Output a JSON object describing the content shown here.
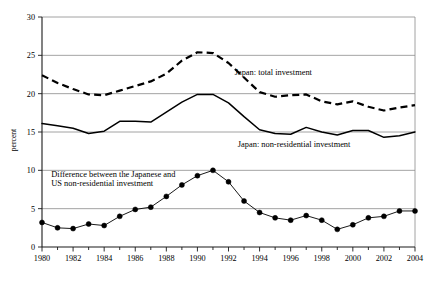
{
  "chart_data": {
    "type": "line",
    "title": "",
    "subtitle": "",
    "xlabel": "",
    "ylabel": "percent",
    "xlim": [
      1980,
      2004
    ],
    "ylim": [
      0,
      30
    ],
    "yticks": [
      0,
      5,
      10,
      15,
      20,
      25,
      30
    ],
    "ytick_labels": [
      "0",
      "5",
      "10",
      "15",
      "20",
      "25",
      "30"
    ],
    "xticks": [
      1980,
      1982,
      1984,
      1986,
      1988,
      1990,
      1992,
      1994,
      1996,
      1998,
      2000,
      2002,
      2004
    ],
    "xtick_labels": [
      "1980",
      "1982",
      "1984",
      "1986",
      "1988",
      "1990",
      "1992",
      "1994",
      "1996",
      "1998",
      "2000",
      "2002",
      "2004"
    ],
    "x_minor_tick_step": 1,
    "grid": "horizontal",
    "legend_position": "inline-annotations",
    "x": [
      1980,
      1981,
      1982,
      1983,
      1984,
      1985,
      1986,
      1987,
      1988,
      1989,
      1990,
      1991,
      1992,
      1993,
      1994,
      1995,
      1996,
      1997,
      1998,
      1999,
      2000,
      2001,
      2002,
      2003,
      2004
    ],
    "series": [
      {
        "name": "Japan: total investment",
        "style": "dashed",
        "marker": "none",
        "color": "#000000",
        "values": [
          22.4,
          21.4,
          20.6,
          19.9,
          19.8,
          20.4,
          21.0,
          21.6,
          22.6,
          24.3,
          25.4,
          25.3,
          24.0,
          22.1,
          20.2,
          19.6,
          19.8,
          19.9,
          19.0,
          18.6,
          19.0,
          18.3,
          17.8,
          18.2,
          18.5
        ]
      },
      {
        "name": "Japan: non-residential investment",
        "style": "solid",
        "marker": "none",
        "color": "#000000",
        "values": [
          16.1,
          15.8,
          15.5,
          14.8,
          15.1,
          16.4,
          16.4,
          16.3,
          17.6,
          18.9,
          19.9,
          19.9,
          18.8,
          17.0,
          15.3,
          14.8,
          14.7,
          15.6,
          15.0,
          14.6,
          15.2,
          15.2,
          14.3,
          14.5,
          15.0
        ]
      },
      {
        "name": "Difference between the Japanese and US non-residential investment",
        "style": "solid-markers",
        "marker": "filled-circle",
        "color": "#000000",
        "values": [
          3.2,
          2.5,
          2.4,
          3.0,
          2.8,
          4.0,
          4.9,
          5.2,
          6.6,
          8.1,
          9.3,
          10.0,
          8.5,
          6.0,
          4.5,
          3.8,
          3.5,
          4.1,
          3.5,
          2.3,
          2.9,
          3.8,
          4.0,
          4.7,
          4.7
        ]
      }
    ],
    "annotations": [
      {
        "id": "total-investment-label",
        "text": "Japan: total investment",
        "x": 1992.4,
        "y": 22.4,
        "anchor": "start"
      },
      {
        "id": "non-residential-label",
        "text": "Japan: non-residential investment",
        "x": 1992.6,
        "y": 13.1,
        "anchor": "start"
      },
      {
        "id": "difference-label-line1",
        "text": "Difference between the Japanese and",
        "x": 1980.6,
        "y": 9.1,
        "anchor": "start"
      },
      {
        "id": "difference-label-line2",
        "text": "US non-residential investment",
        "x": 1980.6,
        "y": 8.0,
        "anchor": "start"
      }
    ],
    "colors": {
      "background": "#ffffff",
      "gridline": "#8c8c8c",
      "axis": "#1a1a1a",
      "frame": "#6f6f6f",
      "series": "#000000"
    }
  }
}
